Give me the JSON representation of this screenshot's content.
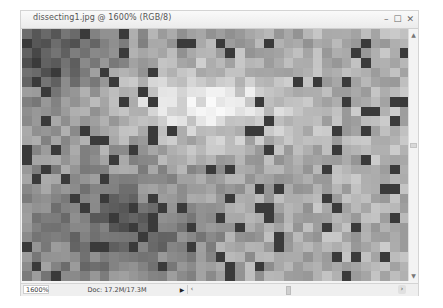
{
  "window": {
    "title": "dissecting1.jpg @ 1600% (RGB/8)",
    "controls": {
      "minimize": "–",
      "maximize": "☐",
      "close": "✕"
    }
  },
  "scrollbar": {
    "up_icon": "▲",
    "down_icon": "▼"
  },
  "statusbar": {
    "zoom": "1600%",
    "doc_info": "Doc: 17.2M/17.3M",
    "menu_arrow": "▶",
    "scroll_left": "‹",
    "scroll_right": "›"
  },
  "canvas": {
    "cols": 40,
    "rows": 26,
    "dark_pixel_color": "#3a3a3a"
  }
}
